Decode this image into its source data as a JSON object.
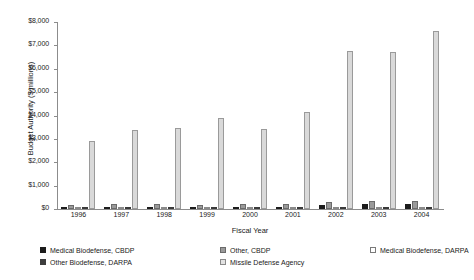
{
  "chart_data": {
    "type": "bar",
    "title": "",
    "xlabel": "Fiscal Year",
    "ylabel": "Budget Authority ($ millions)",
    "categories": [
      "1996",
      "1997",
      "1998",
      "1999",
      "2000",
      "2001",
      "2002",
      "2003",
      "2004"
    ],
    "ylim": [
      0,
      8000
    ],
    "yticks": [
      0,
      1000,
      2000,
      3000,
      4000,
      5000,
      6000,
      7000,
      8000
    ],
    "ytick_labels": [
      "$0",
      "$1,000",
      "$2,000",
      "$3,000",
      "$4,000",
      "$5,000",
      "$6,000",
      "$7,000",
      "$8,000"
    ],
    "grid": false,
    "legend_position": "bottom",
    "series": [
      {
        "name": "Medical Biodefense, CBDP",
        "color": "#1c1c1c",
        "values": [
          40,
          45,
          55,
          60,
          75,
          95,
          175,
          215,
          200
        ]
      },
      {
        "name": "Other, CBDP",
        "color": "#9a9a9a",
        "values": [
          180,
          205,
          235,
          190,
          225,
          200,
          320,
          355,
          330
        ]
      },
      {
        "name": "Medical Biodefense, DARPA",
        "color": "#ffffff",
        "values": [
          15,
          20,
          25,
          30,
          40,
          50,
          70,
          80,
          75
        ]
      },
      {
        "name": "Other Biodefense, DARPA",
        "color": "#4a4a4a",
        "values": [
          10,
          12,
          15,
          18,
          25,
          30,
          45,
          55,
          50
        ]
      },
      {
        "name": "Missile Defense Agency",
        "color": "#d9d9d9",
        "values": [
          2900,
          3370,
          3450,
          3880,
          3430,
          4130,
          6750,
          6730,
          7620
        ]
      }
    ]
  },
  "axis": {
    "y_title": "Budget Authority ($ millions)",
    "x_title": "Fiscal Year"
  }
}
